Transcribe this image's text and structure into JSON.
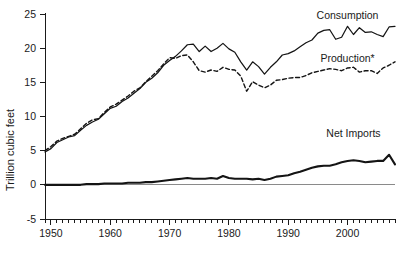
{
  "chart_data": {
    "type": "line",
    "title": "",
    "xlabel": "",
    "ylabel": "Trillion cubic feet",
    "xlim": [
      1949,
      2008
    ],
    "ylim": [
      -5,
      25
    ],
    "grid": false,
    "legend_position": "inline-right",
    "y_ticks": [
      -5,
      0,
      5,
      10,
      15,
      20,
      25
    ],
    "y_tick_labels": [
      "-5",
      "0",
      "5",
      "10",
      "15",
      "20",
      "25"
    ],
    "x_ticks": [
      1950,
      1960,
      1970,
      1980,
      1990,
      2000
    ],
    "x_tick_labels": [
      "1950",
      "1960",
      "1970",
      "1980",
      "1990",
      "2000"
    ],
    "x_minor_tick_interval": 1,
    "zero_reference_line": 0,
    "x": [
      1949,
      1950,
      1951,
      1952,
      1953,
      1954,
      1955,
      1956,
      1957,
      1958,
      1959,
      1960,
      1961,
      1962,
      1963,
      1964,
      1965,
      1966,
      1967,
      1968,
      1969,
      1970,
      1971,
      1972,
      1973,
      1974,
      1975,
      1976,
      1977,
      1978,
      1979,
      1980,
      1981,
      1982,
      1983,
      1984,
      1985,
      1986,
      1987,
      1988,
      1989,
      1990,
      1991,
      1992,
      1993,
      1994,
      1995,
      1996,
      1997,
      1998,
      1999,
      2000,
      2001,
      2002,
      2003,
      2004,
      2005,
      2006,
      2007,
      2008
    ],
    "series": [
      {
        "name": "Consumption",
        "style": "solid",
        "label": "Consumption",
        "values": [
          4.8,
          5.3,
          6.2,
          6.6,
          7.0,
          7.2,
          8.0,
          8.7,
          9.2,
          9.6,
          10.4,
          11.2,
          11.5,
          12.2,
          12.7,
          13.4,
          14.1,
          15.0,
          15.6,
          16.4,
          17.5,
          18.2,
          18.8,
          19.6,
          20.5,
          20.6,
          19.5,
          20.3,
          19.5,
          20.0,
          20.7,
          19.9,
          19.4,
          18.0,
          16.8,
          18.0,
          17.3,
          16.2,
          17.2,
          18.0,
          19.0,
          19.2,
          19.6,
          20.2,
          20.8,
          21.2,
          22.2,
          22.6,
          22.7,
          21.3,
          21.6,
          23.2,
          22.0,
          23.0,
          22.3,
          22.4,
          22.0,
          21.7,
          23.1,
          23.2
        ]
      },
      {
        "name": "Production",
        "style": "dashed",
        "label": "Production*",
        "values": [
          5.0,
          5.6,
          6.4,
          6.8,
          7.1,
          7.4,
          8.2,
          9.0,
          9.5,
          9.7,
          10.6,
          11.4,
          11.8,
          12.4,
          13.0,
          13.7,
          14.2,
          15.1,
          15.9,
          16.7,
          17.7,
          18.6,
          18.5,
          18.9,
          19.0,
          18.0,
          16.7,
          16.5,
          16.8,
          16.6,
          17.2,
          16.9,
          16.8,
          15.9,
          13.7,
          15.1,
          14.6,
          14.2,
          14.6,
          15.3,
          15.4,
          15.6,
          15.7,
          15.7,
          16.0,
          16.4,
          16.6,
          16.8,
          17.0,
          16.9,
          16.7,
          17.1,
          17.2,
          16.5,
          16.7,
          16.7,
          16.3,
          17.1,
          17.5,
          18.0
        ]
      },
      {
        "name": "Net Imports",
        "style": "solid-thick",
        "label": "Net Imports",
        "values": [
          0.0,
          0.0,
          0.0,
          0.0,
          0.0,
          0.0,
          0.0,
          0.1,
          0.1,
          0.1,
          0.2,
          0.2,
          0.2,
          0.2,
          0.3,
          0.3,
          0.3,
          0.4,
          0.4,
          0.5,
          0.6,
          0.7,
          0.8,
          0.9,
          1.0,
          0.9,
          0.9,
          0.9,
          1.0,
          0.9,
          1.3,
          1.0,
          0.9,
          0.9,
          0.9,
          0.8,
          0.9,
          0.7,
          0.9,
          1.2,
          1.3,
          1.4,
          1.7,
          1.9,
          2.2,
          2.5,
          2.7,
          2.8,
          2.8,
          3.0,
          3.3,
          3.5,
          3.6,
          3.5,
          3.3,
          3.4,
          3.5,
          3.5,
          4.4,
          3.0
        ]
      }
    ],
    "annotations": [
      {
        "text": "Consumption",
        "x": 2000,
        "y": 24.3
      },
      {
        "text": "Production*",
        "x": 2000,
        "y": 18.0
      },
      {
        "text": "Net Imports",
        "x": 2001,
        "y": 7.0
      }
    ]
  }
}
